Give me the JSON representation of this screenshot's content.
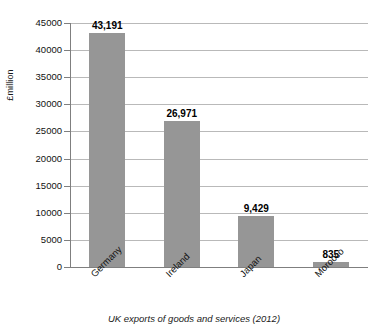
{
  "chart_data": {
    "type": "bar",
    "title": "",
    "subtitle": "",
    "xlabel": "UK exports of goods and services (2012)",
    "ylabel": "£million",
    "categories": [
      "Germany",
      "Ireland",
      "Japan",
      "Morocco"
    ],
    "values": [
      43191,
      26971,
      9429,
      835
    ],
    "value_labels": [
      "43,191",
      "26,971",
      "9,429",
      "835"
    ],
    "series": [
      {
        "name": "UK exports",
        "values": [
          43191,
          26971,
          9429,
          835
        ]
      }
    ],
    "ylim": [
      0,
      45000
    ],
    "ytick_step": 5000,
    "ytick_labels": [
      "45000",
      "40000",
      "35000",
      "30000",
      "25000",
      "20000",
      "15000",
      "10000",
      "5000",
      "0"
    ],
    "ytick_values": [
      45000,
      40000,
      35000,
      30000,
      25000,
      20000,
      15000,
      10000,
      5000,
      0
    ],
    "grid": true,
    "grid_axis": "y",
    "legend": false,
    "legend_position": "none",
    "bar_color": "#969696",
    "gridline_color": "#b9b9b9",
    "axis_color": "#7f7f7f",
    "text_color": "#111111",
    "background_color": "#ffffff",
    "category_label_rotation": -45
  }
}
